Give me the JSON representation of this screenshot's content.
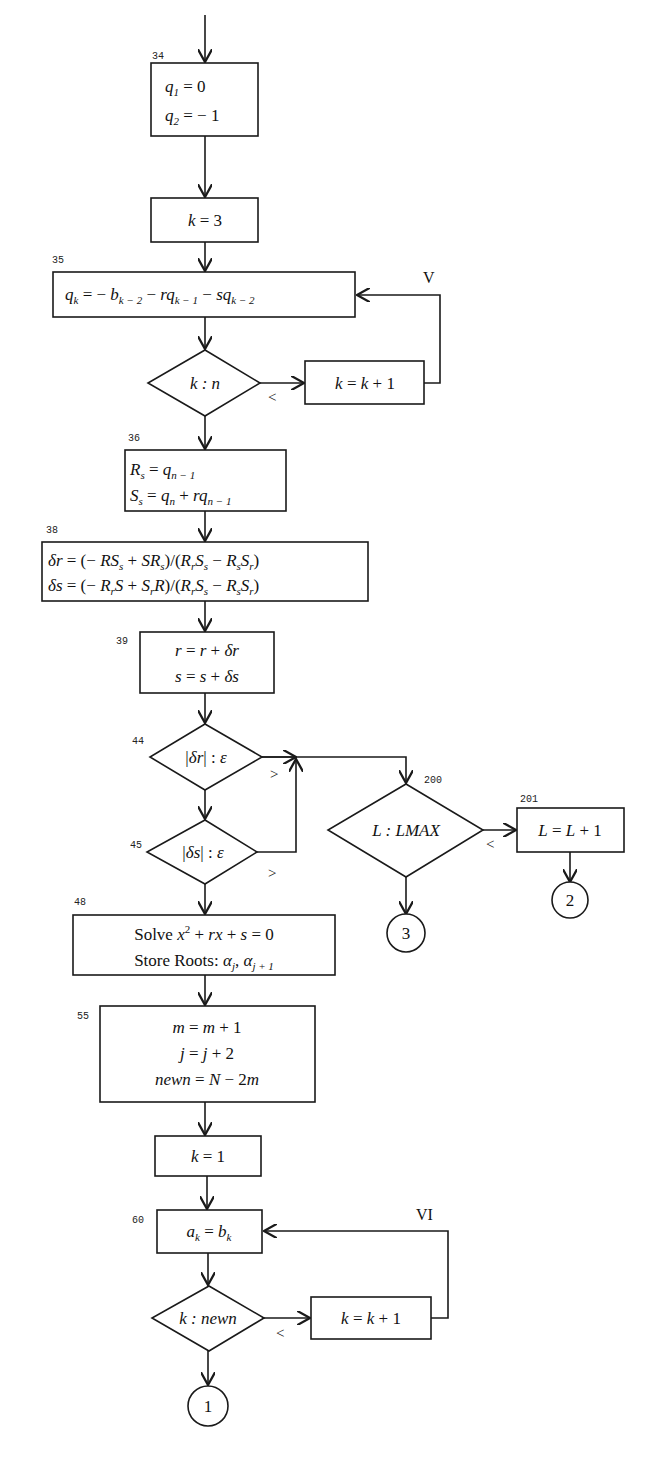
{
  "diagram": {
    "type": "flowchart",
    "entry_arrow": true,
    "nodes": [
      {
        "id": "n34",
        "step": "34",
        "shape": "process",
        "lines": [
          "q₁ = 0",
          "q₂ = − 1"
        ]
      },
      {
        "id": "k3",
        "step": "",
        "shape": "process",
        "lines": [
          "k = 3"
        ]
      },
      {
        "id": "n35",
        "step": "35",
        "shape": "process",
        "lines": [
          "qₖ = − bₖ₋₂ − rqₖ₋₁ − sqₖ₋₂"
        ]
      },
      {
        "id": "dec_kn",
        "step": "",
        "shape": "decision",
        "lines": [
          "k : n"
        ],
        "branch_label": "<"
      },
      {
        "id": "inc_k1",
        "step": "",
        "shape": "process",
        "lines": [
          "k = k + 1"
        ],
        "loop_label": "V"
      },
      {
        "id": "n36",
        "step": "36",
        "shape": "process",
        "lines": [
          "Rₛ = qₙ₋₁",
          "Sₛ = qₙ + rqₙ₋₁"
        ]
      },
      {
        "id": "n38",
        "step": "38",
        "shape": "process",
        "lines": [
          "δr = (− RSₛ + SRₛ)/(RᵣSₛ − RₛSᵣ)",
          "δs = (− RᵣS + SᵣR)/(RᵣSₛ − RₛSᵣ)"
        ]
      },
      {
        "id": "n39",
        "step": "39",
        "shape": "process",
        "lines": [
          "r = r + δr",
          "s = s + δs"
        ]
      },
      {
        "id": "n44",
        "step": "44",
        "shape": "decision",
        "lines": [
          "|δr| : ε"
        ],
        "branch_label": ">"
      },
      {
        "id": "n45",
        "step": "45",
        "shape": "decision",
        "lines": [
          "|δs| : ε"
        ],
        "branch_label": ">"
      },
      {
        "id": "n200",
        "step": "200",
        "shape": "decision",
        "lines": [
          "L : LMAX"
        ],
        "branch_label": "<"
      },
      {
        "id": "n201",
        "step": "201",
        "shape": "process",
        "lines": [
          "L = L + 1"
        ]
      },
      {
        "id": "c3",
        "step": "",
        "shape": "connector",
        "lines": [
          "3"
        ]
      },
      {
        "id": "c2",
        "step": "",
        "shape": "connector",
        "lines": [
          "2"
        ]
      },
      {
        "id": "n48",
        "step": "48",
        "shape": "process",
        "lines": [
          "Solve x² + rx + s = 0",
          "Store Roots: αⱼ, αⱼ₊₁"
        ]
      },
      {
        "id": "n55",
        "step": "55",
        "shape": "process",
        "lines": [
          "m = m + 1",
          "j = j + 2",
          "newn = N − 2m"
        ]
      },
      {
        "id": "k1",
        "step": "",
        "shape": "process",
        "lines": [
          "k = 1"
        ]
      },
      {
        "id": "n60",
        "step": "60",
        "shape": "process",
        "lines": [
          "aₖ = bₖ"
        ]
      },
      {
        "id": "dec_knewn",
        "step": "",
        "shape": "decision",
        "lines": [
          "k : newn"
        ],
        "branch_label": "<"
      },
      {
        "id": "inc_k2",
        "step": "",
        "shape": "process",
        "lines": [
          "k = k + 1"
        ],
        "loop_label": "VI"
      },
      {
        "id": "c1",
        "step": "",
        "shape": "connector",
        "lines": [
          "1"
        ]
      }
    ],
    "labels": {
      "s34": "34",
      "s35": "35",
      "s36": "36",
      "s38": "38",
      "s39": "39",
      "s44": "44",
      "s45": "45",
      "s48": "48",
      "s55": "55",
      "s60": "60",
      "s200": "200",
      "s201": "201",
      "loopV": "V",
      "loopVI": "VI",
      "lt": "<",
      "gt": ">"
    },
    "colors": {
      "ink": "#1a1a1a",
      "paper": "#ffffff"
    }
  }
}
